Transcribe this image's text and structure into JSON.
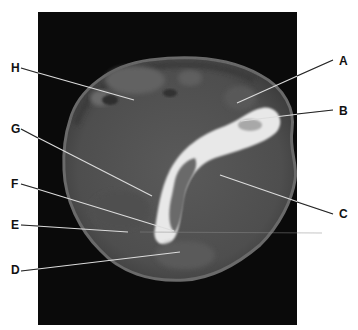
{
  "figure": {
    "type": "CT axial cross-section",
    "labels": [
      {
        "id": "A",
        "text": "A",
        "x": 339,
        "y": 57
      },
      {
        "id": "B",
        "text": "B",
        "x": 339,
        "y": 107
      },
      {
        "id": "C",
        "text": "C",
        "x": 339,
        "y": 210
      },
      {
        "id": "D",
        "text": "D",
        "x": 11,
        "y": 265
      },
      {
        "id": "E",
        "text": "E",
        "x": 11,
        "y": 222
      },
      {
        "id": "F",
        "text": "F",
        "x": 11,
        "y": 182
      },
      {
        "id": "G",
        "text": "G",
        "x": 11,
        "y": 125
      },
      {
        "id": "H",
        "text": "H",
        "x": 11,
        "y": 64
      }
    ]
  }
}
